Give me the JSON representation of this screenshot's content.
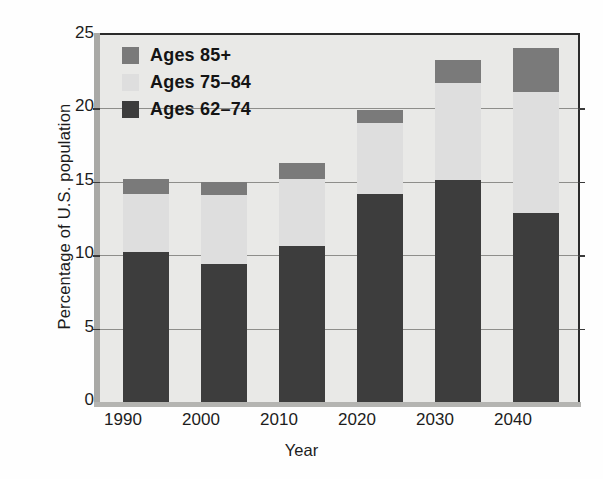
{
  "chart_data": {
    "type": "bar",
    "subtype": "stacked",
    "title": "",
    "xlabel": "Year",
    "ylabel": "Percentage of U.S. population",
    "categories": [
      "1990",
      "2000",
      "2010",
      "2020",
      "2030",
      "2040"
    ],
    "series": [
      {
        "name": "Ages 62–74",
        "color": "#3d3d3d",
        "values": [
          10.2,
          9.4,
          10.6,
          14.2,
          15.1,
          12.9
        ]
      },
      {
        "name": "Ages 75–84",
        "color": "#dedede",
        "values": [
          4.0,
          4.7,
          4.6,
          4.8,
          6.6,
          8.2
        ]
      },
      {
        "name": "Ages 85+",
        "color": "#7a7a7a",
        "values": [
          1.0,
          0.9,
          1.1,
          0.9,
          1.6,
          3.0
        ]
      }
    ],
    "cumulative_tops": {
      "Ages 62–74": [
        10.2,
        9.4,
        10.6,
        14.2,
        15.1,
        12.9
      ],
      "Ages 75–84": [
        14.2,
        14.1,
        15.2,
        19.0,
        21.7,
        21.1
      ],
      "Ages 85+": [
        15.2,
        15.0,
        16.3,
        19.9,
        23.3,
        24.1
      ]
    },
    "ylim": [
      0,
      25
    ],
    "yticks": [
      0,
      5,
      10,
      15,
      20,
      25
    ],
    "ytick_labels": [
      "0",
      "5",
      "10",
      "15",
      "20",
      "25"
    ],
    "grid": true,
    "grid_axis": "y",
    "legend_position": "upper left",
    "legend_order": [
      "Ages 85+",
      "Ages 75–84",
      "Ages 62–74"
    ],
    "plot_background": "#e9e9e7"
  },
  "legend": {
    "items": [
      {
        "label": "Ages 85+",
        "swatch": "#7a7a7a"
      },
      {
        "label": "Ages 75–84",
        "swatch": "#dedede"
      },
      {
        "label": "Ages 62–74",
        "swatch": "#3d3d3d"
      }
    ]
  },
  "axes": {
    "y_title": "Percentage of U.S. population",
    "x_title": "Year",
    "y_tick_labels": [
      "25",
      "20",
      "15",
      "10",
      "5",
      "0"
    ],
    "x_tick_labels": [
      "1990",
      "2000",
      "2010",
      "2020",
      "2030",
      "2040"
    ]
  }
}
